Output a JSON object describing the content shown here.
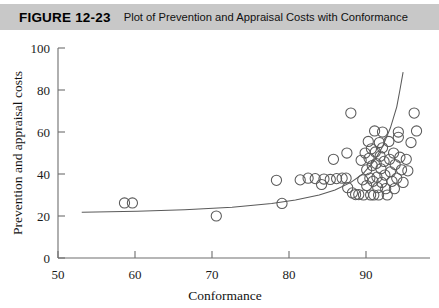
{
  "figure": {
    "number": "FIGURE 12-23",
    "caption": "Plot of Prevention and Appraisal Costs with Conformance"
  },
  "colors": {
    "header_background": "#c8c8c8",
    "axis": "#6e6e6e",
    "marker": "#5a5a5a",
    "page_background": "#ffffff"
  },
  "chart_data": {
    "type": "scatter",
    "title": "Plot of Prevention and Appraisal Costs with Conformance",
    "xlabel": "Conformance",
    "ylabel": "Prevention and appraisal costs",
    "xlim": [
      50,
      97
    ],
    "ylim": [
      0,
      100
    ],
    "xticks": [
      50,
      60,
      70,
      80,
      90
    ],
    "yticks": [
      0,
      20,
      40,
      60,
      80,
      100
    ],
    "grid": false,
    "legend": "none",
    "marker": "open-circle",
    "points": [
      [
        58.4,
        26.2
      ],
      [
        59.4,
        26.2
      ],
      [
        70.0,
        20.0
      ],
      [
        77.6,
        37.0
      ],
      [
        78.3,
        26.0
      ],
      [
        80.6,
        37.2
      ],
      [
        81.6,
        38.0
      ],
      [
        82.5,
        37.8
      ],
      [
        83.3,
        35.0
      ],
      [
        83.6,
        37.6
      ],
      [
        84.4,
        37.4
      ],
      [
        85.2,
        37.8
      ],
      [
        85.9,
        38.0
      ],
      [
        86.4,
        38.0
      ],
      [
        86.6,
        33.5
      ],
      [
        87.0,
        69.0
      ],
      [
        87.2,
        31.0
      ],
      [
        87.6,
        30.2
      ],
      [
        88.0,
        30.2
      ],
      [
        88.3,
        46.5
      ],
      [
        88.5,
        37.2
      ],
      [
        88.6,
        30.0
      ],
      [
        88.8,
        50.0
      ],
      [
        89.0,
        42.0
      ],
      [
        89.0,
        34.5
      ],
      [
        89.2,
        55.5
      ],
      [
        89.3,
        47.5
      ],
      [
        89.4,
        38.0
      ],
      [
        89.5,
        30.0
      ],
      [
        89.6,
        52.0
      ],
      [
        89.7,
        44.0
      ],
      [
        89.8,
        36.5
      ],
      [
        89.9,
        30.0
      ],
      [
        90.0,
        60.5
      ],
      [
        90.1,
        50.5
      ],
      [
        90.2,
        45.0
      ],
      [
        90.3,
        38.5
      ],
      [
        90.4,
        33.5
      ],
      [
        90.5,
        30.0
      ],
      [
        90.6,
        55.0
      ],
      [
        90.7,
        48.5
      ],
      [
        90.8,
        42.5
      ],
      [
        90.9,
        36.0
      ],
      [
        91.0,
        52.5
      ],
      [
        91.2,
        46.0
      ],
      [
        91.3,
        39.5
      ],
      [
        91.4,
        33.0
      ],
      [
        91.6,
        30.0
      ],
      [
        91.8,
        55.5
      ],
      [
        91.9,
        47.0
      ],
      [
        92.0,
        41.0
      ],
      [
        92.2,
        36.5
      ],
      [
        92.4,
        50.0
      ],
      [
        92.6,
        44.5
      ],
      [
        92.8,
        38.0
      ],
      [
        93.0,
        57.5
      ],
      [
        93.2,
        48.0
      ],
      [
        93.4,
        42.0
      ],
      [
        93.6,
        36.0
      ],
      [
        93.0,
        60.0
      ],
      [
        94.0,
        47.0
      ],
      [
        94.2,
        41.5
      ],
      [
        94.6,
        55.0
      ],
      [
        95.0,
        69.0
      ],
      [
        95.3,
        60.5
      ],
      [
        86.5,
        50.0
      ],
      [
        84.8,
        47.0
      ],
      [
        92.5,
        33.0
      ],
      [
        91.0,
        60.0
      ]
    ],
    "trend_curve": {
      "description": "exponential trend line rising from left to right",
      "points": [
        [
          53.0,
          21.8
        ],
        [
          60.0,
          22.3
        ],
        [
          66.0,
          23.0
        ],
        [
          72.0,
          24.2
        ],
        [
          77.0,
          26.0
        ],
        [
          80.0,
          27.6
        ],
        [
          83.0,
          30.0
        ],
        [
          85.0,
          32.4
        ],
        [
          87.0,
          36.0
        ],
        [
          88.5,
          40.0
        ],
        [
          90.0,
          46.5
        ],
        [
          91.0,
          53.0
        ],
        [
          92.0,
          62.0
        ],
        [
          92.8,
          72.0
        ],
        [
          93.2,
          80.0
        ],
        [
          93.6,
          88.5
        ]
      ]
    }
  }
}
